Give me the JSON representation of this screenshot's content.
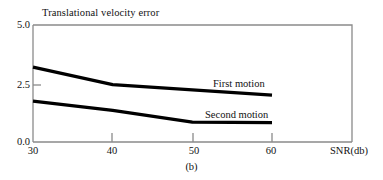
{
  "figure": {
    "caption": "(b)",
    "title": "Translational velocity error"
  },
  "axes": {
    "y_ticks": [
      "5.0",
      "2.5",
      "0.0"
    ],
    "x_ticks": [
      "30",
      "40",
      "50",
      "60"
    ],
    "x_axis_title": "SNR(db)",
    "frame_color": "#7a7a7a",
    "curve_color": "#000000"
  },
  "series_labels": {
    "first": "First motion",
    "second": "Second motion"
  },
  "chart_data": {
    "type": "line",
    "title": "Translational velocity error",
    "xlabel": "SNR(db)",
    "ylabel": "Translational velocity error",
    "xlim": [
      30,
      70
    ],
    "ylim": [
      0.0,
      5.0
    ],
    "xticks": [
      30,
      40,
      50,
      60
    ],
    "yticks": [
      0.0,
      2.5,
      5.0
    ],
    "grid": false,
    "legend": "inline-annotations",
    "annotations": [
      {
        "text": "First motion",
        "x": 53,
        "y": 2.7
      },
      {
        "text": "Second motion",
        "x": 51,
        "y": 1.35
      }
    ],
    "series": [
      {
        "name": "First motion",
        "x": [
          30,
          40,
          60
        ],
        "values": [
          3.2,
          2.45,
          2.0
        ]
      },
      {
        "name": "Second motion",
        "x": [
          30,
          40,
          50,
          60
        ],
        "values": [
          1.75,
          1.35,
          0.85,
          0.83
        ]
      }
    ]
  }
}
